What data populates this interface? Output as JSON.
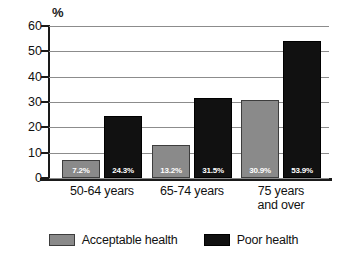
{
  "chart_data": {
    "type": "bar",
    "title": "",
    "xlabel": "",
    "ylabel": "%",
    "unit_label": "%",
    "categories": [
      "50-64 years",
      "65-74 years",
      "75 years and over"
    ],
    "category_lines": [
      [
        "50-64 years"
      ],
      [
        "65-74 years"
      ],
      [
        "75 years",
        "and over"
      ]
    ],
    "series": [
      {
        "name": "Acceptable health",
        "color": "#8a8a8a",
        "values": [
          7.2,
          13.2,
          30.9
        ],
        "labels": [
          "7.2%",
          "13.2%",
          "30.9%"
        ]
      },
      {
        "name": "Poor health",
        "color": "#111111",
        "values": [
          24.3,
          31.5,
          53.9
        ],
        "labels": [
          "24.3%",
          "31.5%",
          "53.9%"
        ]
      }
    ],
    "ylim": [
      0,
      60
    ],
    "yticks": [
      0,
      10,
      20,
      30,
      40,
      50,
      60
    ],
    "ytick_labels": [
      "0",
      "10",
      "20",
      "30",
      "40",
      "50",
      "60"
    ],
    "grid": true,
    "legend_position": "bottom"
  },
  "legend": {
    "items": [
      {
        "label": "Acceptable health",
        "swatch": "acceptable"
      },
      {
        "label": "Poor health",
        "swatch": "poor"
      }
    ]
  }
}
